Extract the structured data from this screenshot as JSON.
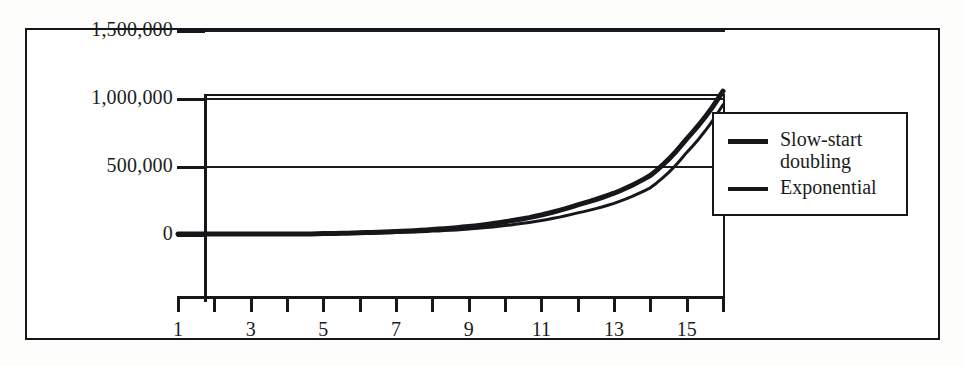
{
  "figure": {
    "background_color": "#ffffff",
    "frame_color": "#15161a",
    "axis_color": "#16171b"
  },
  "legend": {
    "position": "right",
    "entries": [
      {
        "label": "Slow-start\ndoubling",
        "swatch": "thick-line-swatch",
        "color": "#16171b"
      },
      {
        "label": "Exponential",
        "swatch": "thin-line-swatch",
        "color": "#16171b"
      }
    ]
  },
  "chart_data": {
    "type": "line",
    "title": "",
    "xlabel": "",
    "ylabel": "",
    "xlim": [
      1,
      16
    ],
    "ylim": [
      0,
      1500000
    ],
    "grid": true,
    "legend_position": "right",
    "x": [
      1,
      2,
      3,
      4,
      5,
      6,
      7,
      8,
      9,
      10,
      11,
      12,
      13,
      14,
      15,
      16
    ],
    "x_tick_labels": [
      "1",
      "3",
      "5",
      "7",
      "9",
      "11",
      "13",
      "15"
    ],
    "x_tick_values": [
      1,
      3,
      5,
      7,
      9,
      11,
      13,
      15
    ],
    "y_tick_labels": [
      "0",
      "500,000",
      "1,000,000",
      "1,500,000"
    ],
    "y_tick_values": [
      0,
      500000,
      1000000,
      1500000
    ],
    "series": [
      {
        "name": "Slow-start doubling",
        "color": "#16171b",
        "line_width": 5,
        "values": [
          2,
          4,
          8,
          16,
          3000,
          9000,
          18000,
          33000,
          55000,
          90000,
          140000,
          215000,
          300000,
          430000,
          700000,
          1050000
        ]
      },
      {
        "name": "Exponential",
        "color": "#16171b",
        "line_width": 3,
        "values": [
          1,
          2,
          4,
          8,
          1500,
          5000,
          11000,
          21000,
          36000,
          62000,
          100000,
          155000,
          225000,
          340000,
          600000,
          950000
        ]
      }
    ]
  }
}
